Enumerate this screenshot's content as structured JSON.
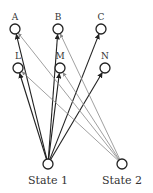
{
  "colors": {
    "state1_edge": "#222222",
    "state2_edge": "#888888",
    "node_stroke": "#222222"
  },
  "nodes": [
    {
      "id": "A",
      "label": "A",
      "x": 15,
      "y": 29
    },
    {
      "id": "B",
      "label": "B",
      "x": 58,
      "y": 29
    },
    {
      "id": "C",
      "label": "C",
      "x": 101,
      "y": 29
    },
    {
      "id": "L",
      "label": "L",
      "x": 18,
      "y": 68
    },
    {
      "id": "M",
      "label": "M",
      "x": 60,
      "y": 68
    },
    {
      "id": "N",
      "label": "N",
      "x": 105,
      "y": 68
    }
  ],
  "states": [
    {
      "id": "S1",
      "label": "State 1",
      "x": 48,
      "y": 164
    },
    {
      "id": "S2",
      "label": "State 2",
      "x": 122,
      "y": 164
    }
  ],
  "edges": [
    {
      "from": "S1",
      "to": "A",
      "style": "dark"
    },
    {
      "from": "S1",
      "to": "B",
      "style": "dark"
    },
    {
      "from": "S1",
      "to": "C",
      "style": "dark"
    },
    {
      "from": "S1",
      "to": "L",
      "style": "dark"
    },
    {
      "from": "S1",
      "to": "M",
      "style": "dark"
    },
    {
      "from": "S1",
      "to": "N",
      "style": "dark"
    },
    {
      "from": "S2",
      "to": "A",
      "style": "gray"
    },
    {
      "from": "S2",
      "to": "B",
      "style": "gray"
    },
    {
      "from": "S2",
      "to": "L",
      "style": "gray"
    },
    {
      "from": "S2",
      "to": "M",
      "style": "gray"
    }
  ]
}
